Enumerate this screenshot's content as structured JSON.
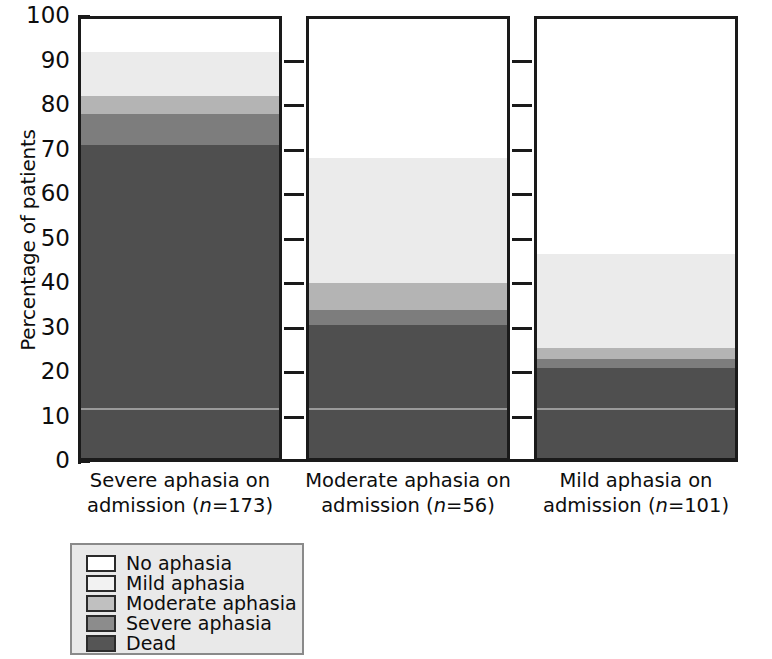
{
  "chart_data": {
    "type": "bar",
    "title": "",
    "subtitle": "",
    "xlabel": "",
    "ylabel": "Percentage of patients",
    "ylim": [
      0,
      100
    ],
    "yticks": [
      0,
      10,
      20,
      30,
      40,
      50,
      60,
      70,
      80,
      90,
      100
    ],
    "grid": "dashed-horizontal-ticks",
    "stacked": true,
    "legend_position": "below-left",
    "categories": [
      "Severe aphasia on admission (n=173)",
      "Moderate aphasia on admission (n=56)",
      "Mild aphasia on admission (n=101)"
    ],
    "category_lines": [
      [
        "Severe aphasia on",
        "admission (n=173)"
      ],
      [
        "Moderate aphasia on",
        "admission (n=56)"
      ],
      [
        "Mild aphasia on",
        "admission (n=101)"
      ]
    ],
    "category_n": [
      173,
      56,
      101
    ],
    "series": [
      {
        "name": "Dead",
        "color": "#4f4f4f",
        "values": [
          71.0,
          30.5,
          21.0
        ]
      },
      {
        "name": "Severe aphasia",
        "color": "#7d7d7d",
        "values": [
          7.0,
          3.5,
          2.0
        ]
      },
      {
        "name": "Moderate aphasia",
        "color": "#b4b4b4",
        "values": [
          4.0,
          6.0,
          2.5
        ]
      },
      {
        "name": "Mild aphasia",
        "color": "#ebebeb",
        "values": [
          10.0,
          28.0,
          21.0
        ]
      },
      {
        "name": "No aphasia",
        "color": "#ffffff",
        "values": [
          8.0,
          32.0,
          53.5
        ]
      }
    ],
    "annotations": [
      {
        "type": "hline",
        "series": "Dead",
        "value": 12.0,
        "note": "thin light rule inside Dead segment of every bar"
      }
    ]
  },
  "legend": {
    "items": [
      {
        "label": "No aphasia",
        "color": "#ffffff"
      },
      {
        "label": "Mild aphasia",
        "color": "#f2f2f2"
      },
      {
        "label": "Moderate aphasia",
        "color": "#c0c0c0"
      },
      {
        "label": "Severe aphasia",
        "color": "#8c8c8c"
      },
      {
        "label": "Dead",
        "color": "#555555"
      }
    ]
  },
  "axis": {
    "y_title": "Percentage of patients",
    "y_tick_labels": [
      "100",
      "90",
      "80",
      "70",
      "60",
      "50",
      "40",
      "30",
      "20",
      "10",
      "0"
    ]
  }
}
